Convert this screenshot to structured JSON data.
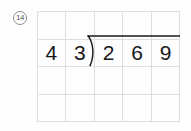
{
  "worksheet": {
    "problem_label": "14",
    "problem_label_style": "circled",
    "background_color": "#fefefe",
    "grid": {
      "columns": 5,
      "rows": 4,
      "line_color": "#dedede",
      "cells": [
        [
          "",
          "",
          "",
          "",
          ""
        ],
        [
          "4",
          "3",
          "2",
          "6",
          "9"
        ],
        [
          "",
          "",
          "",
          "",
          ""
        ],
        [
          "",
          "",
          "",
          "",
          ""
        ]
      ]
    },
    "expression": {
      "type": "long-division",
      "divisor": "43",
      "dividend": "269",
      "divisor_digits": [
        "4",
        "3"
      ],
      "dividend_digits": [
        "2",
        "6",
        "9"
      ],
      "bracket_glyph": ")",
      "ink_color": "#18181a",
      "quotient": ""
    }
  }
}
